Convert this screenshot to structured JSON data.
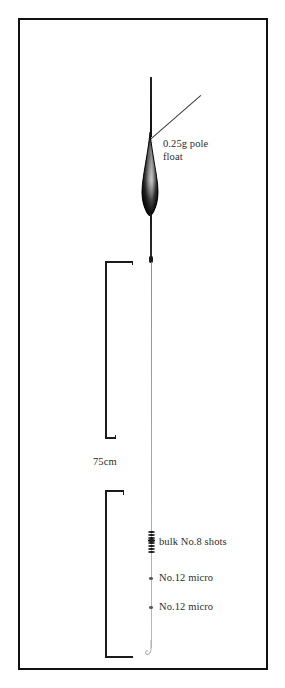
{
  "figure": {
    "background_color": "#ffffff",
    "frame_color": "#111111"
  },
  "labels": {
    "float": "0.25g pole\nfloat",
    "measurement": "75cm",
    "bulk_shots": "bulk No.8 shots",
    "micro_shot_upper": "No.12 micro",
    "micro_shot_lower": "No.12 micro"
  },
  "rig": {
    "float_name": "0.25g pole float",
    "float_body_color": "#1d1d1d",
    "float_fill_color": "#8d8d8d",
    "line_color": "#9a9a9a",
    "antenna_color": "#151515",
    "shot_color": "#1a1a1a",
    "micro_shot_color": "#5a5a5a",
    "depth_measurement": "75cm",
    "bulk_shot_size": "No.8",
    "bulk_shot_count": 8,
    "micro_shot_size": "No.12",
    "micro_shot_count": 2
  }
}
